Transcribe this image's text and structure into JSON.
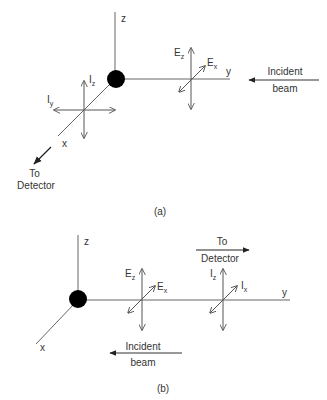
{
  "panel_a": {
    "caption": "(a)",
    "axes": {
      "z": "z",
      "y": "y",
      "x": "x"
    },
    "E_labels": {
      "Ez_main": "E",
      "Ez_sub": "z",
      "Ex_main": "E",
      "Ex_sub": "x"
    },
    "I_labels": {
      "Iz_main": "I",
      "Iz_sub": "z",
      "Iy_main": "I",
      "Iy_sub": "y"
    },
    "incident": {
      "line1": "Incident",
      "line2": "beam"
    },
    "detector": {
      "line1": "To",
      "line2": "Detector"
    }
  },
  "panel_b": {
    "caption": "(b)",
    "axes": {
      "z": "z",
      "y": "y",
      "x": "x"
    },
    "E_labels": {
      "Ez_main": "E",
      "Ez_sub": "z",
      "Ex_main": "E",
      "Ex_sub": "x"
    },
    "I_labels": {
      "Iz_main": "I",
      "Iz_sub": "z",
      "Ix_main": "I",
      "Ix_sub": "x"
    },
    "incident": {
      "line1": "Incident",
      "line2": "beam"
    },
    "detector": {
      "line1": "To",
      "line2": "Detector"
    }
  },
  "colors": {
    "line": "#555555",
    "ball": "#000000",
    "text": "#333333"
  }
}
